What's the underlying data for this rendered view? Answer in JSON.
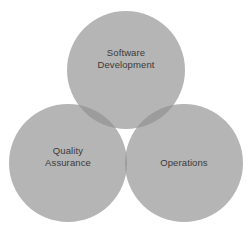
{
  "diagram": {
    "type": "venn-3-circle",
    "title": "",
    "background_color": "#ffffff",
    "circle_fill": "#b5b5b5",
    "overlap_pair_fill": "#9c9c9c",
    "overlap_triple_fill": "#8e8e8e",
    "label_color": "#3a3a3a",
    "sets": [
      {
        "id": "software-development",
        "label": "Software\nDevelopment",
        "position": "top",
        "cx": 126,
        "cy": 70,
        "r": 59
      },
      {
        "id": "quality-assurance",
        "label": "Quality\nAssurance",
        "position": "bottom-left",
        "cx": 68,
        "cy": 163,
        "r": 59
      },
      {
        "id": "operations",
        "label": "Operations",
        "position": "bottom-right",
        "cx": 184,
        "cy": 163,
        "r": 59
      }
    ]
  }
}
